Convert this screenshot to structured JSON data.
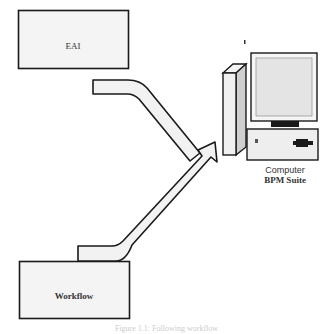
{
  "diagram": {
    "nodes": [
      {
        "id": "eai",
        "label": "EAI"
      },
      {
        "id": "workflow",
        "label": "Workflow"
      },
      {
        "id": "computer",
        "label": "Computer",
        "sublabel": "BPM Suite"
      }
    ],
    "edges": [
      {
        "from": "eai",
        "to": "computer"
      },
      {
        "from": "workflow",
        "to": "computer"
      }
    ],
    "caption": "Figure 1.1: Following workflow",
    "colors": {
      "stroke": "#1a1a1a",
      "fill": "#f2f2f2",
      "screen": "#e6e6e6"
    }
  }
}
